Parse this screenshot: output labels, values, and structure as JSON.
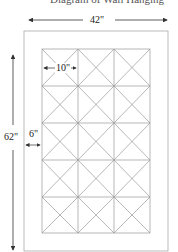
{
  "diagram": {
    "title_partial": "Diagram of Wall Hanging",
    "dimensions": {
      "width_label": "42\"",
      "height_label": "62\"",
      "border_label": "6\"",
      "block_label": "10\""
    },
    "grid": {
      "columns": 3,
      "rows": 5,
      "block_pattern": "X-diagonal"
    },
    "colors": {
      "line": "#999999",
      "arrow": "#333333",
      "frame": "#aaaaaa"
    }
  }
}
